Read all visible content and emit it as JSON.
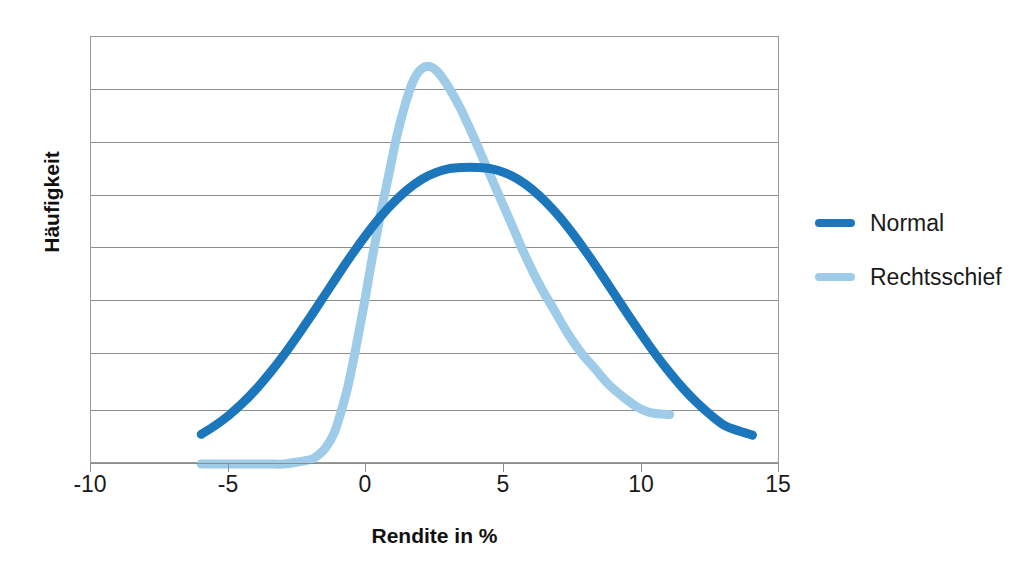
{
  "chart_data": {
    "type": "line",
    "title": "",
    "xlabel": "Rendite in %",
    "ylabel": "Häufigkeit",
    "xlim": [
      -10,
      15
    ],
    "ylim": [
      0,
      1.08
    ],
    "xticks": [
      -10,
      -5,
      0,
      5,
      10,
      15
    ],
    "xtick_labels": [
      "-10",
      "-5",
      "0",
      "5",
      "10",
      "15"
    ],
    "ytick_labels": [],
    "grid": "horizontal",
    "gridline_count": 7,
    "legend_position": "right",
    "series": [
      {
        "name": "Normal",
        "color": "#1B76BC",
        "x": [
          -6,
          -5.5,
          -5,
          -4.5,
          -4,
          -3.5,
          -3,
          -2.5,
          -2,
          -1.5,
          -1,
          -0.5,
          0,
          0.5,
          1,
          1.5,
          2,
          2.5,
          3,
          3.5,
          4,
          4.5,
          5,
          5.5,
          6,
          6.5,
          7,
          7.5,
          8,
          8.5,
          9,
          9.5,
          10,
          10.5,
          11,
          11.5,
          12,
          12.5,
          13,
          13.5,
          14
        ],
        "y": [
          0.075,
          0.097,
          0.123,
          0.154,
          0.19,
          0.231,
          0.276,
          0.325,
          0.376,
          0.429,
          0.482,
          0.533,
          0.581,
          0.625,
          0.663,
          0.695,
          0.72,
          0.737,
          0.747,
          0.75,
          0.75,
          0.747,
          0.737,
          0.72,
          0.695,
          0.663,
          0.625,
          0.581,
          0.533,
          0.482,
          0.429,
          0.376,
          0.325,
          0.276,
          0.231,
          0.19,
          0.154,
          0.123,
          0.097,
          0.084,
          0.073
        ]
      },
      {
        "name": "Rechtsschief",
        "color": "#9DCBE8",
        "x": [
          -6,
          -5.5,
          -5,
          -4.5,
          -4,
          -3.5,
          -3,
          -2.5,
          -2,
          -1.8,
          -1.5,
          -1.2,
          -1,
          -0.7,
          -0.4,
          -0.1,
          0.2,
          0.5,
          0.8,
          1.1,
          1.4,
          1.7,
          2,
          2.3,
          2.6,
          3,
          3.4,
          3.8,
          4.3,
          4.8,
          5.3,
          5.8,
          6.3,
          6.8,
          7.3,
          7.8,
          8.3,
          8.8,
          9.3,
          9.8,
          10.3,
          11
        ],
        "y": [
          0.0,
          0.0,
          0.0,
          0.0,
          0.0,
          0.0,
          0.0,
          0.005,
          0.012,
          0.02,
          0.04,
          0.075,
          0.115,
          0.19,
          0.29,
          0.4,
          0.52,
          0.63,
          0.73,
          0.83,
          0.91,
          0.97,
          1.0,
          1.005,
          0.99,
          0.95,
          0.9,
          0.84,
          0.76,
          0.68,
          0.6,
          0.52,
          0.45,
          0.39,
          0.33,
          0.28,
          0.24,
          0.2,
          0.17,
          0.145,
          0.13,
          0.125
        ]
      }
    ]
  },
  "legend": {
    "items": [
      {
        "label": "Normal",
        "color": "#1B76BC"
      },
      {
        "label": "Rechtsschief",
        "color": "#9DCBE8"
      }
    ]
  },
  "axes": {
    "x_title": "Rendite in %",
    "y_title": "Häufigkeit",
    "x_tick_labels": [
      "-10",
      "-5",
      "0",
      "5",
      "10",
      "15"
    ]
  }
}
